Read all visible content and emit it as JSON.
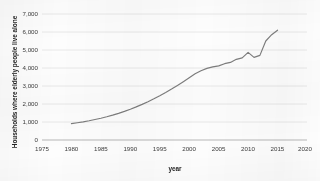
{
  "chart_data": {
    "type": "line",
    "title": "",
    "xlabel": "year",
    "ylabel": "Households where elderly people live alone",
    "xlim": [
      1975,
      2020
    ],
    "ylim": [
      0,
      7000
    ],
    "grid": true,
    "legend": "none",
    "xticks": [
      "1975",
      "1980",
      "1985",
      "1990",
      "1995",
      "2000",
      "2005",
      "2010",
      "2015",
      "2020"
    ],
    "yticks": [
      "0",
      "1,000",
      "2,000",
      "3,000",
      "4,000",
      "5,000",
      "6,000",
      "7,000"
    ],
    "line_color": "#7d7d7d",
    "grid_color": "#d8d8d8",
    "series": [
      {
        "name": "Households where elderly people live alone",
        "x": [
          1980,
          1981,
          1982,
          1983,
          1984,
          1985,
          1986,
          1987,
          1988,
          1989,
          1990,
          1991,
          1992,
          1993,
          1994,
          1995,
          1996,
          1997,
          1998,
          1999,
          2000,
          2001,
          2002,
          2003,
          2004,
          2005,
          2006,
          2007,
          2008,
          2009,
          2010,
          2011,
          2012,
          2013,
          2014,
          2015
        ],
        "values": [
          910,
          960,
          1010,
          1070,
          1140,
          1210,
          1290,
          1380,
          1480,
          1590,
          1710,
          1840,
          1980,
          2130,
          2290,
          2460,
          2640,
          2830,
          3030,
          3240,
          3460,
          3680,
          3850,
          3980,
          4060,
          4120,
          4240,
          4310,
          4480,
          4560,
          4870,
          4590,
          4700,
          5500,
          5850,
          6100
        ]
      }
    ]
  }
}
